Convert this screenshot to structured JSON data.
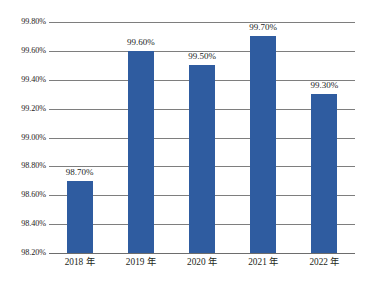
{
  "chart_data": {
    "type": "bar",
    "title": "",
    "xlabel": "",
    "ylabel": "",
    "categories": [
      "2018 年",
      "2019 年",
      "2020 年",
      "2021 年",
      "2022 年"
    ],
    "values": [
      98.7,
      99.6,
      99.5,
      99.7,
      99.3
    ],
    "value_labels": [
      "98.70%",
      "99.60%",
      "99.50%",
      "99.70%",
      "99.30%"
    ],
    "ylim": [
      98.2,
      99.8
    ],
    "ytick_values": [
      99.8,
      99.6,
      99.4,
      99.2,
      99.0,
      98.8,
      98.6,
      98.4,
      98.2
    ],
    "ytick_labels": [
      "99.80%",
      "99.60%",
      "99.40%",
      "99.20%",
      "99.00%",
      "98.80%",
      "98.60%",
      "98.40%",
      "98.20%"
    ],
    "grid": true,
    "legend_position": "none",
    "series": [
      {
        "name": "",
        "color": "#2F5CA0",
        "values": [
          98.7,
          99.6,
          99.5,
          99.7,
          99.3
        ]
      }
    ]
  },
  "colors": {
    "bar": "#2F5CA0",
    "gridline": "#7E7E7E",
    "text": "#221F1F",
    "background": "#FFFFFF"
  },
  "caption": {
    "text": ""
  }
}
